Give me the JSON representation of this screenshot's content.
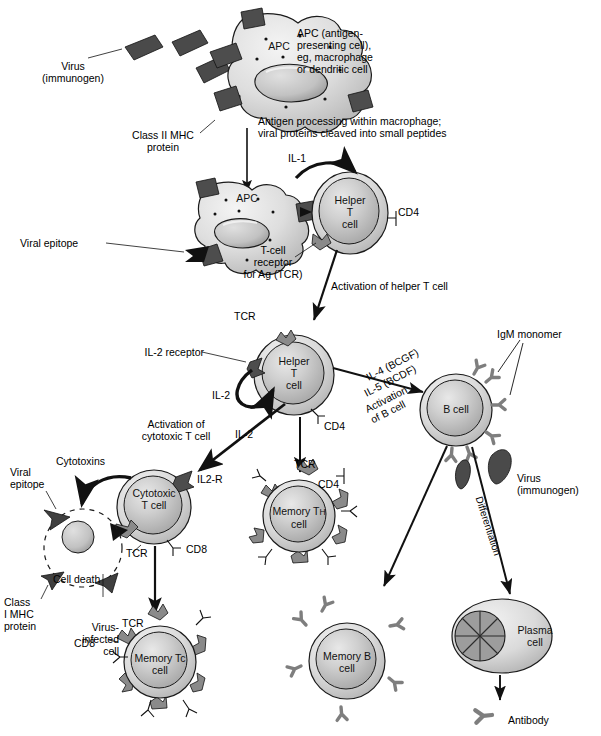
{
  "figure": {
    "type": "biology-flow-diagram"
  },
  "colors": {
    "cell_fill": "#c9c9c9",
    "cell_rim": "#d8d8d8",
    "nucleus": "#b8b8b8",
    "mhc_dark": "#4d4d4d",
    "virus_dark": "#4a4a4a",
    "receptor_gray": "#8a8a8a",
    "stroke": "#1a1a1a",
    "background": "#ffffff"
  },
  "labels": {
    "virus_top": "Virus\n(immunogen)",
    "apc_top": "APC",
    "apc_desc": "APC (antigen-\npresenting cell),\neg, macrophage\nor dendritic cell",
    "class2_mhc": "Class II MHC\nprotein",
    "antigen_processing": "Antigen processing within macrophage;\nviral proteins cleaved into small peptides",
    "il1": "IL-1",
    "apc_mid": "APC",
    "helper_t_1": "Helper\nT\ncell",
    "cd4_1": "CD4",
    "viral_epitope_mid": "Viral epitope",
    "tcr_for_ag": "T-cell\nreceptor\nfor Ag (TCR)",
    "activation_helper": "Activation of helper T cell",
    "tcr_helper2": "TCR",
    "il2_receptor": "IL-2 receptor",
    "helper_t_2": "Helper\nT\ncell",
    "cd4_2": "CD4",
    "il2_a": "IL-2",
    "il2_b": "IL-2",
    "activation_cytotoxic": "Activation of\ncytotoxic T cell",
    "il4_bcgf": "IL-4 (BCGF)",
    "il5_bcdf": "IL-5 (BCDF)",
    "activation_b": "Activation\nof B cell",
    "igm_monomer": "IgM monomer",
    "b_cell": "B cell",
    "virus_right": "Virus\n(immunogen)",
    "differentiation": "Differentiation",
    "cytotoxins": "Cytotoxins",
    "viral_epitope_left": "Viral\nepitope",
    "cytotoxic_t": "Cytotoxic\nT cell",
    "il2r": "IL2-R",
    "cd8_1": "CD8",
    "tcr_cytotoxic": "TCR",
    "cell_death": "Cell death",
    "class1_mhc": "Class\nI MHC\nprotein",
    "virus_infected": "Virus-\ninfected\ncell",
    "tcr_memorytc": "TCR",
    "cd8_2": "CD8",
    "memory_tc": "Memory Tc\ncell",
    "tcr_memoryth": "TCR",
    "cd4_3": "CD4",
    "memory_th_pre": "Memory T",
    "memory_th_sub": "H",
    "memory_th_post": "\ncell",
    "memory_b": "Memory B\ncell",
    "plasma_cell": "Plasma\ncell",
    "antibody": "Antibody"
  }
}
